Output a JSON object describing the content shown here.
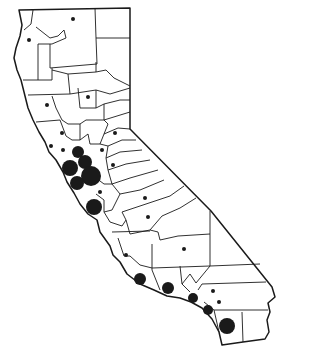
{
  "map": {
    "subject": "California county map with proportional symbols",
    "colors": {
      "background": "#ffffff",
      "line": "#1a1a1a",
      "symbol": "#1a1a1a"
    },
    "symbols": [
      {
        "id": "modoc-area",
        "x": 73,
        "y": 19,
        "r": 2
      },
      {
        "id": "humboldt-area",
        "x": 29,
        "y": 40,
        "r": 2
      },
      {
        "id": "butte-area",
        "x": 88,
        "y": 97,
        "r": 2
      },
      {
        "id": "mendocino-area",
        "x": 47,
        "y": 105,
        "r": 2
      },
      {
        "id": "placer-area",
        "x": 115,
        "y": 133,
        "r": 2
      },
      {
        "id": "sonoma-area",
        "x": 62,
        "y": 133,
        "r": 2
      },
      {
        "id": "sacramento-area",
        "x": 102,
        "y": 150,
        "r": 2
      },
      {
        "id": "marin-area",
        "x": 51,
        "y": 146,
        "r": 2
      },
      {
        "id": "solano-area",
        "x": 63,
        "y": 150,
        "r": 2
      },
      {
        "id": "san-joaquin-area",
        "x": 113,
        "y": 165,
        "r": 2
      },
      {
        "id": "napa-contra-costa",
        "x": 78,
        "y": 152,
        "r": 6
      },
      {
        "id": "san-francisco",
        "x": 70,
        "y": 168,
        "r": 8
      },
      {
        "id": "alameda",
        "x": 85,
        "y": 162,
        "r": 7
      },
      {
        "id": "santa-clara",
        "x": 91,
        "y": 176,
        "r": 10
      },
      {
        "id": "san-mateo",
        "x": 77,
        "y": 183,
        "r": 7
      },
      {
        "id": "stanislaus-area",
        "x": 100,
        "y": 192,
        "r": 2
      },
      {
        "id": "santa-cruz-monterey",
        "x": 94,
        "y": 207,
        "r": 8
      },
      {
        "id": "mariposa-area",
        "x": 145,
        "y": 198,
        "r": 2
      },
      {
        "id": "fresno-area",
        "x": 148,
        "y": 217,
        "r": 2
      },
      {
        "id": "kern-area",
        "x": 184,
        "y": 249,
        "r": 2
      },
      {
        "id": "san-luis-obispo",
        "x": 126,
        "y": 255,
        "r": 2
      },
      {
        "id": "santa-barbara",
        "x": 140,
        "y": 279,
        "r": 6
      },
      {
        "id": "ventura",
        "x": 168,
        "y": 288,
        "r": 6
      },
      {
        "id": "los-angeles-north",
        "x": 213,
        "y": 291,
        "r": 2
      },
      {
        "id": "los-angeles",
        "x": 193,
        "y": 298,
        "r": 5
      },
      {
        "id": "san-bernardino",
        "x": 219,
        "y": 302,
        "r": 2
      },
      {
        "id": "orange",
        "x": 208,
        "y": 310,
        "r": 5
      },
      {
        "id": "san-diego",
        "x": 227,
        "y": 326,
        "r": 8
      }
    ]
  }
}
